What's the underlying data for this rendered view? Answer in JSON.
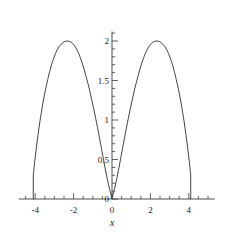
{
  "chart_data": {
    "type": "line",
    "title": "",
    "subtitle": "",
    "xlabel": "x",
    "ylabel": "",
    "grid": false,
    "legend": null,
    "background_color": "#ffffff",
    "curve_color": "#3a3a3a",
    "axis_color": "#3a3a3a",
    "xlim": [
      -4.85,
      5.35
    ],
    "ylim": [
      -0.06,
      2.12
    ],
    "xticks": [
      -4,
      -2,
      0,
      2,
      4
    ],
    "xtick_labels": [
      "-4",
      "-2",
      "0",
      "2",
      "4"
    ],
    "yticks": [
      0,
      0.5,
      1,
      1.5,
      2
    ],
    "ytick_labels": [
      "0",
      "0.5",
      "1",
      "1.5",
      "2"
    ],
    "x_minor_tick_step": 0.5,
    "y_minor_tick_step": 0.1,
    "series": [
      {
        "name": "curve",
        "x": [
          -4.1,
          -4.1,
          -4.05,
          -3.95,
          -3.85,
          -3.75,
          -3.65,
          -3.55,
          -3.45,
          -3.35,
          -3.25,
          -3.15,
          -3.05,
          -2.95,
          -2.85,
          -2.75,
          -2.65,
          -2.55,
          -2.45,
          -2.35,
          -2.25,
          -2.15,
          -2.05,
          -1.95,
          -1.85,
          -1.75,
          -1.65,
          -1.55,
          -1.45,
          -1.35,
          -1.25,
          -1.15,
          -1.05,
          -0.95,
          -0.85,
          -0.75,
          -0.65,
          -0.55,
          -0.45,
          -0.35,
          -0.25,
          -0.18,
          -0.12,
          -0.07,
          -0.03,
          0.0,
          0.03,
          0.07,
          0.12,
          0.18,
          0.25,
          0.35,
          0.45,
          0.55,
          0.65,
          0.75,
          0.85,
          0.95,
          1.05,
          1.15,
          1.25,
          1.35,
          1.45,
          1.55,
          1.65,
          1.75,
          1.85,
          1.95,
          2.05,
          2.15,
          2.25,
          2.35,
          2.45,
          2.55,
          2.65,
          2.75,
          2.85,
          2.95,
          3.05,
          3.15,
          3.25,
          3.35,
          3.45,
          3.55,
          3.65,
          3.75,
          3.85,
          3.95,
          4.05,
          4.1,
          4.1
        ],
        "y": [
          0.0,
          0.3,
          0.42,
          0.63,
          0.82,
          0.99,
          1.14,
          1.28,
          1.4,
          1.51,
          1.61,
          1.7,
          1.77,
          1.84,
          1.89,
          1.93,
          1.96,
          1.98,
          1.995,
          2.0,
          1.998,
          1.99,
          1.97,
          1.94,
          1.9,
          1.85,
          1.79,
          1.72,
          1.64,
          1.55,
          1.46,
          1.36,
          1.25,
          1.14,
          1.02,
          0.9,
          0.77,
          0.64,
          0.51,
          0.38,
          0.26,
          0.18,
          0.12,
          0.07,
          0.03,
          0.0,
          0.03,
          0.07,
          0.12,
          0.18,
          0.26,
          0.38,
          0.51,
          0.64,
          0.77,
          0.9,
          1.02,
          1.14,
          1.25,
          1.36,
          1.46,
          1.55,
          1.64,
          1.72,
          1.79,
          1.85,
          1.9,
          1.94,
          1.97,
          1.99,
          1.998,
          2.0,
          1.995,
          1.98,
          1.96,
          1.93,
          1.89,
          1.84,
          1.77,
          1.7,
          1.61,
          1.51,
          1.4,
          1.28,
          1.14,
          0.99,
          0.82,
          0.63,
          0.42,
          0.3,
          0.0
        ]
      }
    ]
  },
  "axis_titles": {
    "x": "x"
  }
}
